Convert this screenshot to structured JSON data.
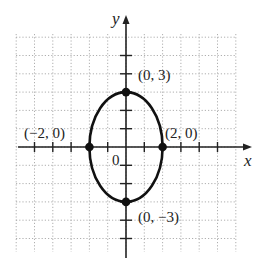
{
  "chart_data": {
    "type": "scatter",
    "title": "",
    "xlabel": "x",
    "ylabel": "y",
    "origin_label": "0",
    "xlim": [
      -4,
      6
    ],
    "ylim": [
      -5,
      6
    ],
    "grid": true,
    "curve": {
      "shape": "ellipse",
      "center": [
        0,
        0
      ],
      "semi_axis_x": 2,
      "semi_axis_y": 3,
      "equation": "x^2/4 + y^2/9 = 1"
    },
    "points": [
      {
        "x": 0,
        "y": 3,
        "label": "(0, 3)"
      },
      {
        "x": 2,
        "y": 0,
        "label": "(2, 0)"
      },
      {
        "x": -2,
        "y": 0,
        "label": "(−2, 0)"
      },
      {
        "x": 0,
        "y": -3,
        "label": "(0, −3)"
      }
    ]
  }
}
